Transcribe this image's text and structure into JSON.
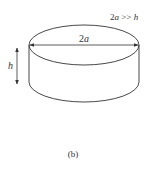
{
  "figure": {
    "caption": "(b)",
    "diameter_label_num": "2",
    "diameter_label_var": "a",
    "height_label": "h",
    "condition_label": {
      "prefix": "2",
      "var_a": "a",
      "relation": " >> ",
      "var_h": "h"
    },
    "stroke_color": "#333333"
  }
}
